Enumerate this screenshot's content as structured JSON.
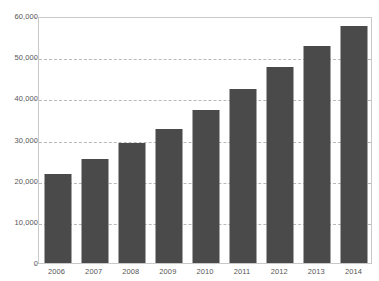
{
  "chart_data": {
    "type": "bar",
    "title": "",
    "subtitle": "",
    "xlabel": "",
    "ylabel": "",
    "categories": [
      "2006",
      "2007",
      "2008",
      "2009",
      "2010",
      "2011",
      "2012",
      "2013",
      "2014"
    ],
    "values": [
      21600,
      25200,
      29100,
      32500,
      37100,
      42200,
      47600,
      52700,
      57500
    ],
    "series": [
      {
        "name": "",
        "values": [
          21600,
          25200,
          29100,
          32500,
          37100,
          42200,
          47600,
          52700,
          57500
        ]
      }
    ],
    "ylim": [
      0,
      60000
    ],
    "yticks": [
      0,
      10000,
      20000,
      30000,
      40000,
      50000,
      60000
    ],
    "ytick_labels": [
      "0",
      "10,000",
      "20,000",
      "30,000",
      "40,000",
      "50,000",
      "60,000"
    ],
    "xtick_labels": [
      "2006",
      "2007",
      "2008",
      "2009",
      "2010",
      "2011",
      "2012",
      "2013",
      "2014"
    ],
    "grid": true,
    "grid_axis": "y",
    "grid_style": "dashed",
    "legend": null,
    "legend_position": "none",
    "annotations": [],
    "colors": {
      "bar": "#4a4a4a",
      "gridline": "#b9b9b9",
      "axis_border": "#c9c9c9",
      "tick_label": "#555555",
      "background": "#ffffff"
    }
  }
}
